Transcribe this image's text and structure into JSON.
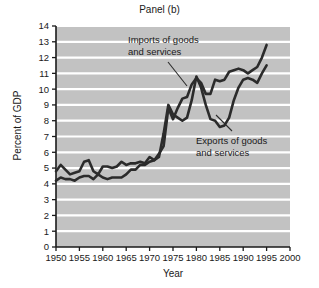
{
  "chart_data": {
    "type": "line",
    "title": "Panel (b)",
    "xlabel": "Year",
    "ylabel": "Percent of GDP",
    "xlim": [
      1950,
      2000
    ],
    "ylim": [
      0,
      14
    ],
    "xticks": [
      1950,
      1955,
      1960,
      1965,
      1970,
      1975,
      1980,
      1985,
      1990,
      1995,
      2000
    ],
    "yticks": [
      0,
      1,
      2,
      3,
      4,
      5,
      6,
      7,
      8,
      9,
      10,
      11,
      12,
      13,
      14
    ],
    "grid": "horizontal",
    "legend_position": "inline-annotations",
    "plot_bgcolor": "#c2c2c2",
    "gridline_color": "#ffffff",
    "line_color": "#2b2b2b",
    "annotations": [
      {
        "name": "imports-annotation",
        "text_line1": "Imports of goods",
        "text_line2": "and services",
        "series": "Imports of goods and services"
      },
      {
        "name": "exports-annotation",
        "text_line1": "Exports of goods",
        "text_line2": "and services",
        "series": "Exports of goods and services"
      }
    ],
    "x": [
      1950,
      1951,
      1952,
      1953,
      1954,
      1955,
      1956,
      1957,
      1958,
      1959,
      1960,
      1961,
      1962,
      1963,
      1964,
      1965,
      1966,
      1967,
      1968,
      1969,
      1970,
      1971,
      1972,
      1973,
      1974,
      1975,
      1976,
      1977,
      1978,
      1979,
      1980,
      1981,
      1982,
      1983,
      1984,
      1985,
      1986,
      1987,
      1988,
      1989,
      1990,
      1991,
      1992,
      1993,
      1994,
      1995
    ],
    "series": [
      {
        "name": "Imports of goods and services",
        "values": [
          4.2,
          4.4,
          4.3,
          4.3,
          4.2,
          4.4,
          4.5,
          4.5,
          4.3,
          4.6,
          4.4,
          4.3,
          4.4,
          4.4,
          4.4,
          4.6,
          4.9,
          4.9,
          5.2,
          5.2,
          5.4,
          5.5,
          5.9,
          6.4,
          8.8,
          8.1,
          8.8,
          9.4,
          9.5,
          10.3,
          10.7,
          10.4,
          9.7,
          9.7,
          10.6,
          10.5,
          10.6,
          11.1,
          11.2,
          11.3,
          11.2,
          11.0,
          11.2,
          11.4,
          12.0,
          12.8
        ]
      },
      {
        "name": "Exports of goods and services",
        "values": [
          4.8,
          5.2,
          4.9,
          4.6,
          4.7,
          4.8,
          5.4,
          5.5,
          4.8,
          4.6,
          5.1,
          5.1,
          5.0,
          5.1,
          5.4,
          5.2,
          5.3,
          5.3,
          5.4,
          5.3,
          5.7,
          5.5,
          5.7,
          7.2,
          9.0,
          8.4,
          8.2,
          8.0,
          8.2,
          9.3,
          10.8,
          10.1,
          9.0,
          8.1,
          8.0,
          7.6,
          7.7,
          8.2,
          9.3,
          10.1,
          10.6,
          10.7,
          10.6,
          10.4,
          11.0,
          11.5
        ]
      }
    ]
  }
}
